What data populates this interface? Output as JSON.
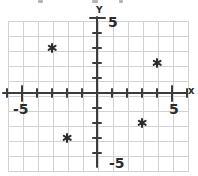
{
  "chart_data": {
    "type": "scatter",
    "title": "",
    "xlabel": "x",
    "ylabel": "Y",
    "xlim": [
      -6,
      6
    ],
    "ylim": [
      -5,
      5
    ],
    "grid": true,
    "points": [
      {
        "x": -3,
        "y": 3
      },
      {
        "x": 4,
        "y": 2
      },
      {
        "x": 3,
        "y": -2
      },
      {
        "x": -2,
        "y": -3
      }
    ],
    "marker": "asterisk",
    "x_tick_units": [
      -6,
      -5,
      -4,
      -3,
      -2,
      -1,
      1,
      2,
      3,
      4,
      5,
      6
    ],
    "y_tick_units": [
      5,
      4,
      3,
      2,
      1,
      -1,
      -2,
      -3,
      -4
    ],
    "x_long_tick_units": [
      -5,
      5
    ],
    "y_long_tick_units": [
      5
    ],
    "tick_labels": {
      "x_max": "5",
      "x_min": "-5",
      "y_max": "5",
      "y_min": "-5"
    }
  }
}
